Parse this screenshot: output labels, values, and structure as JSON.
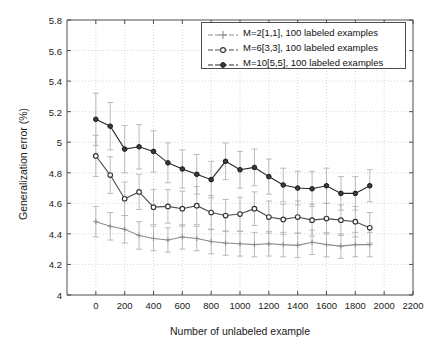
{
  "chart_data": {
    "type": "line",
    "title": "",
    "xlabel": "Number of unlabeled example",
    "ylabel": "Generalization error (%)",
    "xlim": [
      -200,
      2200
    ],
    "ylim": [
      4,
      5.8
    ],
    "xticks": [
      0,
      200,
      400,
      600,
      800,
      1000,
      1200,
      1400,
      1600,
      1800,
      2000,
      2200
    ],
    "yticks": [
      "4",
      "4.2",
      "4.4",
      "4.6",
      "4.8",
      "5",
      "5.2",
      "5.4",
      "5.6",
      "5.8"
    ],
    "grid": true,
    "legend_position": "upper right",
    "error_bars": true,
    "x": [
      0,
      100,
      200,
      300,
      400,
      500,
      600,
      700,
      800,
      900,
      1000,
      1100,
      1200,
      1300,
      1400,
      1500,
      1600,
      1700,
      1800,
      1900
    ],
    "series": [
      {
        "name": "M=2[1,1], 100 labeled examples",
        "marker": "plus",
        "color": "#8c8c8c",
        "values": [
          4.48,
          4.45,
          4.43,
          4.39,
          4.37,
          4.36,
          4.38,
          4.37,
          4.35,
          4.34,
          4.335,
          4.33,
          4.335,
          4.33,
          4.325,
          4.345,
          4.33,
          4.32,
          4.33,
          4.33
        ],
        "errors": [
          0.1,
          0.09,
          0.09,
          0.09,
          0.08,
          0.08,
          0.08,
          0.08,
          0.08,
          0.08,
          0.08,
          0.08,
          0.08,
          0.08,
          0.08,
          0.08,
          0.08,
          0.08,
          0.08,
          0.08
        ]
      },
      {
        "name": "M=6[3,3], 100 labeled examples",
        "marker": "circle",
        "color": "#4d4d4d",
        "values": [
          4.91,
          4.785,
          4.63,
          4.675,
          4.575,
          4.58,
          4.565,
          4.585,
          4.54,
          4.52,
          4.53,
          4.565,
          4.51,
          4.495,
          4.51,
          4.49,
          4.5,
          4.49,
          4.48,
          4.44
        ],
        "errors": [
          0.135,
          0.12,
          0.11,
          0.115,
          0.115,
          0.11,
          0.115,
          0.125,
          0.11,
          0.105,
          0.11,
          0.11,
          0.105,
          0.1,
          0.105,
          0.105,
          0.1,
          0.1,
          0.1,
          0.1
        ]
      },
      {
        "name": "M=10[5,5], 100 labeled examples",
        "marker": "filled-circle",
        "color": "#262626",
        "values": [
          5.15,
          5.105,
          4.955,
          4.97,
          4.94,
          4.865,
          4.825,
          4.79,
          4.755,
          4.875,
          4.82,
          4.835,
          4.775,
          4.72,
          4.7,
          4.695,
          4.715,
          4.665,
          4.665,
          4.715
        ],
        "errors": [
          0.17,
          0.155,
          0.155,
          0.145,
          0.135,
          0.13,
          0.125,
          0.13,
          0.12,
          0.12,
          0.12,
          0.12,
          0.115,
          0.11,
          0.11,
          0.115,
          0.115,
          0.11,
          0.11,
          0.105
        ]
      }
    ]
  },
  "legend": {
    "entries": [
      "M=2[1,1], 100 labeled examples",
      "M=6[3,3], 100 labeled examples",
      "M=10[5,5], 100 labeled examples"
    ]
  },
  "axes": {
    "xlabel": "Number of unlabeled example",
    "ylabel": "Generalization error (%)"
  },
  "style": {
    "axis_color": "#4d4d4d",
    "grid_color": "#cccccc",
    "background": "#ffffff"
  }
}
